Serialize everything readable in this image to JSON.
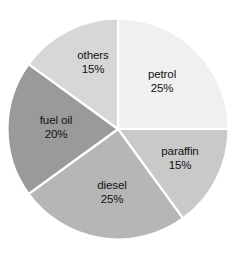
{
  "chart_data": {
    "type": "pie",
    "title": "",
    "xlabel": "",
    "ylabel": "",
    "legend_position": "none",
    "labels_inside_slices": true,
    "value_suffix": "%",
    "total": 100,
    "start_angle_deg": 0,
    "direction": "clockwise",
    "categories": [
      "petrol",
      "paraffin",
      "diesel",
      "fuel oil",
      "others"
    ],
    "values": [
      25,
      15,
      25,
      20,
      15
    ],
    "slices": [
      {
        "label": "petrol",
        "value": 25,
        "value_text": "25%",
        "color": "#f0f0f0",
        "start_deg": 0,
        "end_deg": 90,
        "label_x": 162,
        "label_y": 81
      },
      {
        "label": "paraffin",
        "value": 15,
        "value_text": "15%",
        "color": "#c9c9c9",
        "start_deg": 90,
        "end_deg": 144,
        "label_x": 180,
        "label_y": 158
      },
      {
        "label": "diesel",
        "value": 25,
        "value_text": "25%",
        "color": "#b6b6b6",
        "start_deg": 144,
        "end_deg": 234,
        "label_x": 112,
        "label_y": 192
      },
      {
        "label": "fuel oil",
        "value": 20,
        "value_text": "20%",
        "color": "#9a9a9a",
        "start_deg": 234,
        "end_deg": 306,
        "label_x": 56,
        "label_y": 127
      },
      {
        "label": "others",
        "value": 15,
        "value_text": "15%",
        "color": "#d7d7d7",
        "start_deg": 306,
        "end_deg": 360,
        "label_x": 93,
        "label_y": 62
      }
    ],
    "geometry": {
      "center_x": 118,
      "center_y": 129,
      "radius": 110.5,
      "separator_color": "#ffffff"
    },
    "background_color": "#ffffff",
    "text_color": "#111111"
  }
}
